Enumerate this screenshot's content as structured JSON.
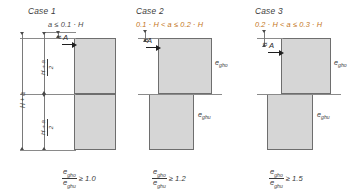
{
  "figure": {
    "type": "engineering-diagram"
  },
  "cases": [
    {
      "id": "case-1",
      "title": "Case 1",
      "condition": "a ≤ 0.1 · H",
      "condition_color": "#4a4a4a",
      "arrow_label": "A",
      "offset_label": "a",
      "dim_outer": "H + a",
      "dim_upper_num": "H + a",
      "dim_upper_den": "2",
      "dim_lower_num": "H + a",
      "dim_lower_den": "2",
      "result_num": "e",
      "result_num_sub": "gho",
      "result_den": "e",
      "result_den_sub": "ghu",
      "result_rhs": "≥ 1.0",
      "upper_label": "",
      "lower_label": ""
    },
    {
      "id": "case-2",
      "title": "Case 2",
      "condition": "0.1 · H < a ≤ 0.2 · H",
      "condition_color": "#c4761c",
      "arrow_label": "A",
      "offset_label": "a",
      "result_num": "e",
      "result_num_sub": "gho",
      "result_den": "e",
      "result_den_sub": "ghu",
      "result_rhs": "≥ 1.2",
      "upper_label": "e",
      "upper_label_sub": "gho",
      "lower_label": "e",
      "lower_label_sub": "ghu"
    },
    {
      "id": "case-3",
      "title": "Case 3",
      "condition": "0.2 · H < a ≤ 0.3 · H",
      "condition_color": "#c4761c",
      "arrow_label": "A",
      "offset_label": "a",
      "result_num": "e",
      "result_num_sub": "gho",
      "result_den": "e",
      "result_den_sub": "ghu",
      "result_rhs": "≥ 1.5",
      "upper_label": "e",
      "upper_label_sub": "gho",
      "lower_label": "e",
      "lower_label_sub": "ghu"
    }
  ],
  "colors": {
    "block_fill": "#d6d6d6",
    "block_stroke": "#6e6e6e",
    "text": "#3a3a3a",
    "accent_orange": "#c4761c",
    "arrow": "#1e1e1e"
  }
}
